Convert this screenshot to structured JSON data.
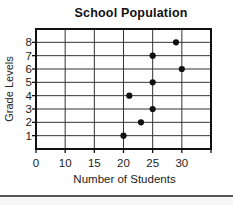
{
  "chart_data": {
    "type": "scatter",
    "title": "School Population",
    "xlabel": "Number of Students",
    "ylabel": "Grade Levels",
    "x_tick_labels": [
      "0",
      "10",
      "15",
      "20",
      "25",
      "30"
    ],
    "x_tick_values": [
      0,
      10,
      15,
      20,
      25,
      30
    ],
    "x_scale_note": "non-uniform: one grid column spans 0-10, then 5 students per column; one unlabeled column right of 30",
    "y_categories": [
      "1",
      "2",
      "3",
      "4",
      "5",
      "6",
      "7",
      "8"
    ],
    "points": [
      {
        "grade": 1,
        "students": 20
      },
      {
        "grade": 2,
        "students": 23
      },
      {
        "grade": 3,
        "students": 25
      },
      {
        "grade": 4,
        "students": 21
      },
      {
        "grade": 5,
        "students": 25
      },
      {
        "grade": 6,
        "students": 30
      },
      {
        "grade": 7,
        "students": 25
      },
      {
        "grade": 8,
        "students": 29
      }
    ],
    "grid": true,
    "legend": false
  },
  "colors": {
    "background": "#ffffff",
    "text": "#111111",
    "grid_line": "#333333",
    "plot_border": "#111111",
    "dot": "#111111",
    "divider": "#555555"
  }
}
